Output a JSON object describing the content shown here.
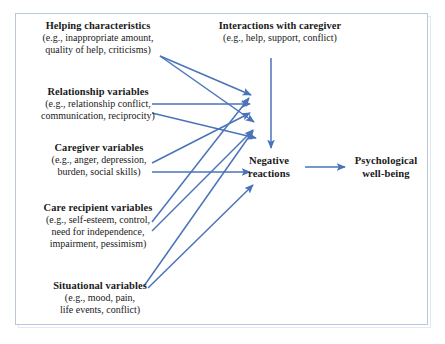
{
  "diagram": {
    "type": "flow-diagram",
    "border_color": "#b9c6dd",
    "arrow_color": "#4a74b8",
    "text_color": "#1a1a1a",
    "nodes": [
      {
        "id": "helping",
        "title": "Helping characteristics",
        "detail": "(e.g., inappropriate amount,\nquality of help, criticisms)"
      },
      {
        "id": "relationship",
        "title": "Relationship variables",
        "detail": "(e.g., relationship conflict,\ncommunication, reciprocity)"
      },
      {
        "id": "caregiver",
        "title": "Caregiver variables",
        "detail": "(e.g., anger, depression,\nburden, social skills)"
      },
      {
        "id": "care_recipient",
        "title": "Care recipient variables",
        "detail": "(e.g., self-esteem, control,\nneed for independence,\nimpairment, pessimism)"
      },
      {
        "id": "situational",
        "title": "Situational variables",
        "detail": "(e.g., mood, pain,\nlife events, conflict)"
      },
      {
        "id": "interactions",
        "title": "Interactions with caregiver",
        "detail": "(e.g., help, support, conflict)"
      },
      {
        "id": "negative_reactions",
        "title": "Negative\nreactions",
        "detail": ""
      },
      {
        "id": "wellbeing",
        "title": "Psychological\nwell-being",
        "detail": ""
      }
    ],
    "edges": [
      {
        "from": "helping",
        "to": "negative_reactions"
      },
      {
        "from": "relationship",
        "to": "negative_reactions"
      },
      {
        "from": "caregiver",
        "to": "negative_reactions"
      },
      {
        "from": "care_recipient",
        "to": "negative_reactions"
      },
      {
        "from": "situational",
        "to": "negative_reactions"
      },
      {
        "from": "interactions",
        "to": "negative_reactions"
      },
      {
        "from": "negative_reactions",
        "to": "wellbeing"
      }
    ]
  }
}
